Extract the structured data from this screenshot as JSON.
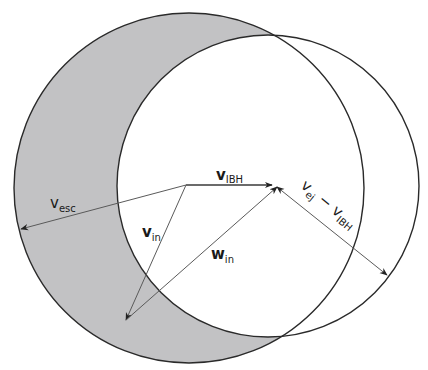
{
  "diagram": {
    "type": "velocity-space diagram",
    "colors": {
      "shaded_region": "#c2c2c4",
      "circle_stroke": "#2a2a2a",
      "vector_stroke": "#5a5a5a",
      "background": "#ffffff"
    },
    "circles": [
      {
        "id": "escape-circle",
        "cx": 189,
        "cy": 188,
        "r": 175
      },
      {
        "id": "ejecta-circle",
        "cx": 268,
        "cy": 186,
        "r": 151
      }
    ],
    "vectors": [
      {
        "id": "v_IBH",
        "from": [
          186,
          185
        ],
        "to": [
          272,
          185
        ],
        "bold": true
      },
      {
        "id": "v_in",
        "from": [
          186,
          185
        ],
        "to": [
          126,
          320
        ]
      },
      {
        "id": "w_in",
        "from": [
          126,
          320
        ],
        "to": [
          277,
          187
        ]
      },
      {
        "id": "v_esc",
        "from": [
          186,
          185
        ],
        "to": [
          21,
          229
        ]
      },
      {
        "id": "v_ej_minus_v_IBH",
        "from": [
          277,
          187
        ],
        "to": [
          387,
          275
        ]
      }
    ],
    "labels": {
      "v_ibh": {
        "main": "v",
        "sub": "IBH"
      },
      "v_esc": {
        "main": "v",
        "sub": "esc"
      },
      "v_in": {
        "main": "v",
        "sub": "in"
      },
      "w_in": {
        "main": "w",
        "sub": "in"
      },
      "v_ej_minus_v_ibh": {
        "main1": "v",
        "sub1": "ej",
        "op": " − ",
        "main2": "v",
        "sub2": "IBH"
      }
    }
  }
}
